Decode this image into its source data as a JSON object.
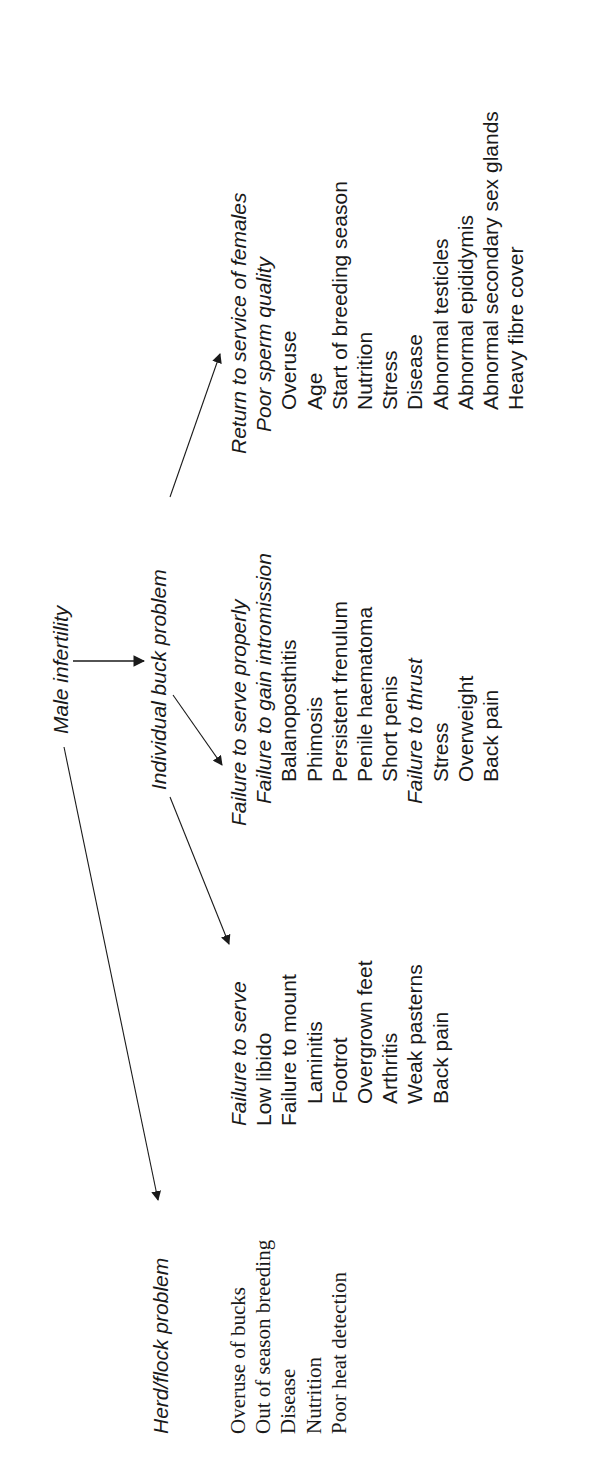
{
  "diagram": {
    "title": "Male infertility",
    "branches": {
      "individual": {
        "label": "Individual buck problem"
      },
      "herd": {
        "label": "Herd/flock problem"
      }
    },
    "failure_to_serve": {
      "heading": "Failure to serve",
      "items": [
        {
          "text": "Low libido",
          "level": 1
        },
        {
          "text": "Failure to mount",
          "level": 1
        },
        {
          "text": "Laminitis",
          "level": 2
        },
        {
          "text": "Footrot",
          "level": 2
        },
        {
          "text": "Overgrown feet",
          "level": 2
        },
        {
          "text": "Arthritis",
          "level": 2
        },
        {
          "text": "Weak pasterns",
          "level": 2
        },
        {
          "text": "Back pain",
          "level": 2
        }
      ]
    },
    "failure_to_serve_properly": {
      "heading": "Failure to serve properly",
      "items": [
        {
          "text": "Failure to gain intromission",
          "level": 2,
          "italic": true
        },
        {
          "text": "Balanoposthitis",
          "level": 3
        },
        {
          "text": "Phimosis",
          "level": 3
        },
        {
          "text": "Persistent frenulum",
          "level": 3
        },
        {
          "text": "Penile haematoma",
          "level": 3
        },
        {
          "text": "Short penis",
          "level": 3
        },
        {
          "text": "Failure to thrust",
          "level": 2,
          "italic": true
        },
        {
          "text": "Stress",
          "level": 3
        },
        {
          "text": "Overweight",
          "level": 3
        },
        {
          "text": "Back pain",
          "level": 3
        }
      ]
    },
    "return_to_service": {
      "heading": "Return to service of females",
      "items": [
        {
          "text": "Poor sperm quality",
          "level": 2,
          "italic": true
        },
        {
          "text": "Overuse",
          "level": 3
        },
        {
          "text": "Age",
          "level": 3
        },
        {
          "text": "Start of breeding season",
          "level": 3
        },
        {
          "text": "Nutrition",
          "level": 3
        },
        {
          "text": "Stress",
          "level": 3
        },
        {
          "text": "Disease",
          "level": 3
        },
        {
          "text": "Abnormal testicles",
          "level": 3
        },
        {
          "text": "Abnormal epididymis",
          "level": 3
        },
        {
          "text": "Abnormal secondary sex glands",
          "level": 3
        },
        {
          "text": "Heavy fibre cover",
          "level": 3
        }
      ]
    },
    "herd_flock_items": [
      "Overuse of bucks",
      "Out of season breeding",
      "Disease",
      "Nutrition",
      "Poor heat detection"
    ],
    "colors": {
      "text": "#1a1a1a",
      "line": "#1a1a1a",
      "background": "#ffffff"
    }
  }
}
